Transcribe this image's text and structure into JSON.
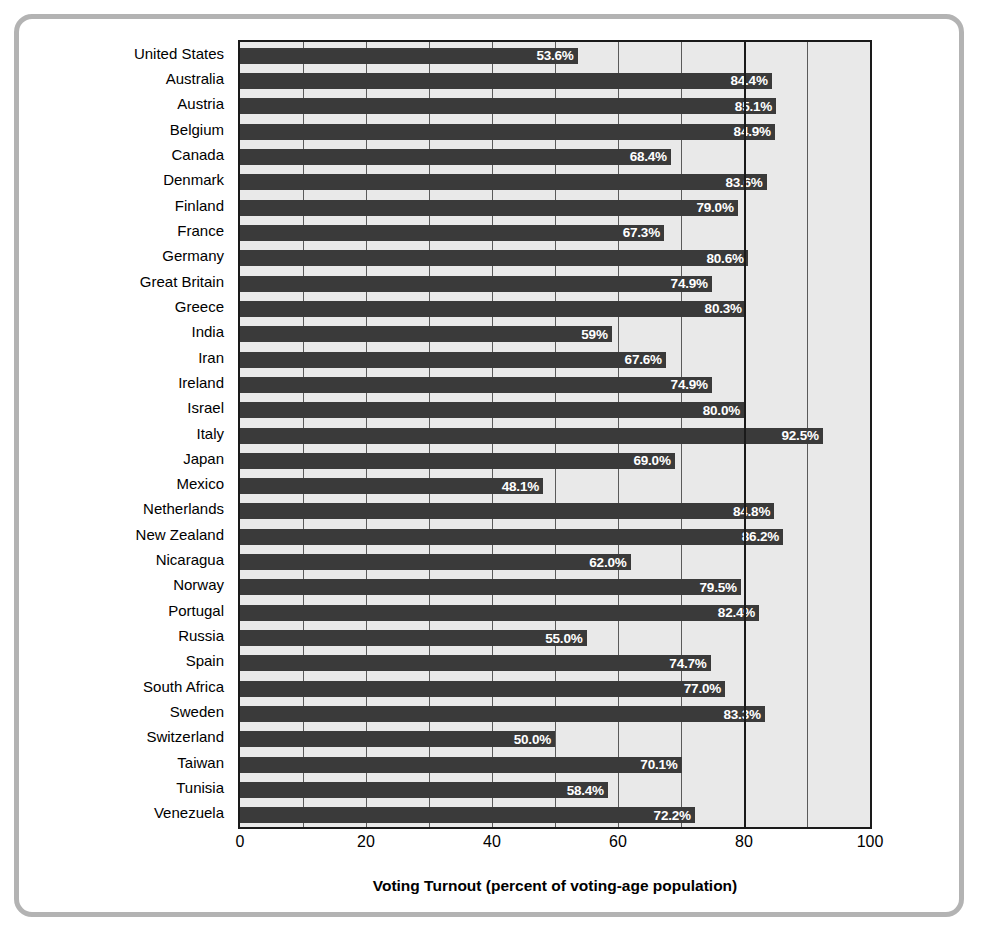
{
  "chart_data": {
    "type": "bar",
    "orientation": "horizontal",
    "title": "",
    "xlabel": "Voting Turnout (percent of voting-age population)",
    "ylabel": "",
    "xlim": [
      0,
      100
    ],
    "xticks": [
      "0",
      "20",
      "40",
      "60",
      "80",
      "100"
    ],
    "xtick_values": [
      0,
      20,
      40,
      60,
      80,
      100
    ],
    "gridlines": [
      10,
      20,
      30,
      40,
      50,
      60,
      70,
      80,
      90
    ],
    "major_gridline": 80,
    "grid": true,
    "legend": "none",
    "bar_color": "#3a3a3a",
    "plot_background": "#e9e9e9",
    "value_label_color": "#ffffff",
    "categories": [
      "United States",
      "Australia",
      "Austria",
      "Belgium",
      "Canada",
      "Denmark",
      "Finland",
      "France",
      "Germany",
      "Great Britain",
      "Greece",
      "India",
      "Iran",
      "Ireland",
      "Israel",
      "Italy",
      "Japan",
      "Mexico",
      "Netherlands",
      "New Zealand",
      "Nicaragua",
      "Norway",
      "Portugal",
      "Russia",
      "Spain",
      "South Africa",
      "Sweden",
      "Switzerland",
      "Taiwan",
      "Tunisia",
      "Venezuela"
    ],
    "values": [
      53.6,
      84.4,
      85.1,
      84.9,
      68.4,
      83.6,
      79.0,
      67.3,
      80.6,
      74.9,
      80.3,
      59.0,
      67.6,
      74.9,
      80.0,
      92.5,
      69.0,
      48.1,
      84.8,
      86.2,
      62.0,
      79.5,
      82.4,
      55.0,
      74.7,
      77.0,
      83.3,
      50.0,
      70.1,
      58.4,
      72.2
    ],
    "value_labels": [
      "53.6%",
      "84.4%",
      "85.1%",
      "84.9%",
      "68.4%",
      "83.6%",
      "79.0%",
      "67.3%",
      "80.6%",
      "74.9%",
      "80.3%",
      "59%",
      "67.6%",
      "74.9%",
      "80.0%",
      "92.5%",
      "69.0%",
      "48.1%",
      "84.8%",
      "86.2%",
      "62.0%",
      "79.5%",
      "82.4%",
      "55.0%",
      "74.7%",
      "77.0%",
      "83.3%",
      "50.0%",
      "70.1%",
      "58.4%",
      "72.2%"
    ]
  }
}
